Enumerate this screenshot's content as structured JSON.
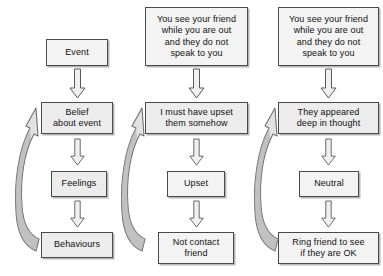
{
  "diagram": {
    "colors": {
      "box_fill": "#ececec",
      "box_fill_light": "#f3f3f3",
      "box_border": "#4a4a4a",
      "arrow_fill": "#f0f0f0",
      "arrow_stroke": "#5a5a5a",
      "loop_fill_light": "#e2e2e2",
      "loop_fill_dark": "#9c9c9c",
      "text": "#101010",
      "background": "#ffffff"
    },
    "columns": [
      {
        "name": "generic-model",
        "nodes": [
          {
            "id": "event",
            "label": "Event"
          },
          {
            "id": "belief",
            "label": "Belief\nabout event"
          },
          {
            "id": "feelings",
            "label": "Feelings"
          },
          {
            "id": "behaviours",
            "label": "Behaviours"
          }
        ],
        "loop": {
          "from": "behaviours",
          "to": "belief",
          "label": "feedback-loop"
        }
      },
      {
        "name": "example-negative",
        "nodes": [
          {
            "id": "situation-1",
            "label": "You see your friend\nwhile you are out\nand they do not\nspeak to you"
          },
          {
            "id": "thought-1",
            "label": "I must have upset\nthem somehow"
          },
          {
            "id": "emotion-1",
            "label": "Upset"
          },
          {
            "id": "behaviour-1",
            "label": "Not contact\nfriend"
          }
        ],
        "loop": {
          "from": "behaviour-1",
          "to": "thought-1",
          "label": "feedback-loop"
        }
      },
      {
        "name": "example-neutral",
        "nodes": [
          {
            "id": "situation-2",
            "label": "You see your friend\nwhile you are out\nand they do not\nspeak to you"
          },
          {
            "id": "thought-2",
            "label": "They appeared\ndeep in thought"
          },
          {
            "id": "emotion-2",
            "label": "Neutral"
          },
          {
            "id": "behaviour-2",
            "label": "Ring friend to see\nif they are OK"
          }
        ],
        "loop": {
          "from": "behaviour-2",
          "to": "thought-2",
          "label": "feedback-loop"
        }
      }
    ]
  }
}
